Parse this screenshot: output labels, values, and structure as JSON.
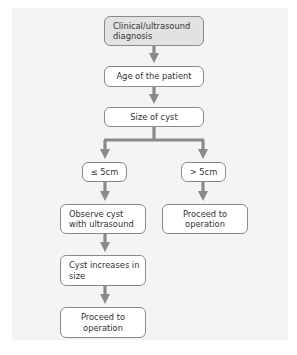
{
  "diagram": {
    "type": "flowchart",
    "colors": {
      "panel_background": "#f4f4f4",
      "start_node_fill": "#e2e2e2",
      "node_fill": "#ffffff",
      "node_border": "#8a8a8a",
      "arrow": "#8a8a8a",
      "text": "#333333"
    },
    "nodes": {
      "start": {
        "label": "Clinical/ultrasound diagnosis"
      },
      "age": {
        "label": "Age of the patient"
      },
      "size": {
        "label": "Size of cyst"
      },
      "small": {
        "label": "≤ 5cm"
      },
      "large": {
        "label": "> 5cm"
      },
      "observe": {
        "label": "Observe cyst with ultrasound"
      },
      "operate_large": {
        "label": "Proceed to operation"
      },
      "increase": {
        "label": "Cyst increases in size"
      },
      "operate_small": {
        "label": "Proceed to operation"
      }
    },
    "edges": [
      {
        "from": "start",
        "to": "age"
      },
      {
        "from": "age",
        "to": "size"
      },
      {
        "from": "size",
        "to": "small"
      },
      {
        "from": "size",
        "to": "large"
      },
      {
        "from": "small",
        "to": "observe"
      },
      {
        "from": "large",
        "to": "operate_large"
      },
      {
        "from": "observe",
        "to": "increase"
      },
      {
        "from": "increase",
        "to": "operate_small"
      }
    ]
  }
}
